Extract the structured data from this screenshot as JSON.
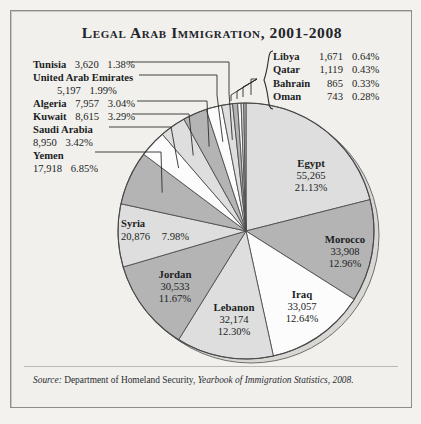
{
  "figure": {
    "title": "Legal Arab Immigration, 2001-2008",
    "source_prefix": "Source:",
    "source_agency": "Department of Homeland Security,",
    "source_publication": "Yearbook of Immigration Statistics, 2008."
  },
  "colors": {
    "paper": "#f1f0ec",
    "border": "#8d8d8d",
    "gray_slice": "#b4b4b4",
    "light_slice": "#dedede",
    "white_slice": "#fcfcfc",
    "outline": "#4a4a4a",
    "text": "#1c1e24"
  },
  "slice_labels": [
    {
      "name": "Egypt",
      "value": "55,265",
      "percent": "21.13%"
    },
    {
      "name": "Morocco",
      "value": "33,908",
      "percent": "12.96%"
    },
    {
      "name": "Iraq",
      "value": "33,057",
      "percent": "12.64%"
    },
    {
      "name": "Lebanon",
      "value": "32,174",
      "percent": "12.30%"
    },
    {
      "name": "Jordan",
      "value": "30,533",
      "percent": "11.67%"
    },
    {
      "name": "Syria",
      "value": "20,876",
      "percent": "7.98%"
    }
  ],
  "left_labels": [
    {
      "name": "Tunisia",
      "value": "3,620",
      "percent": "1.38%",
      "wrap": false
    },
    {
      "name": "United Arab Emirates",
      "value": "5,197",
      "percent": "1.99%",
      "wrap": true
    },
    {
      "name": "Algeria",
      "value": "7,957",
      "percent": "3.04%",
      "wrap": false
    },
    {
      "name": "Kuwait",
      "value": "8,615",
      "percent": "3.29%",
      "wrap": false
    },
    {
      "name": "Saudi Arabia",
      "value": "8,950",
      "percent": "3.42%",
      "wrap": true
    },
    {
      "name": "Yemen",
      "value": "17,918",
      "percent": "6.85%",
      "wrap": true
    }
  ],
  "right_labels": [
    {
      "name": "Libya",
      "value": "1,671",
      "percent": "0.64%"
    },
    {
      "name": "Qatar",
      "value": "1,119",
      "percent": "0.43%"
    },
    {
      "name": "Bahrain",
      "value": "865",
      "percent": "0.33%"
    },
    {
      "name": "Oman",
      "value": "743",
      "percent": "0.28%"
    }
  ],
  "chart_data": {
    "type": "pie",
    "title": "Legal Arab Immigration, 2001-2008",
    "xlabel": "",
    "ylabel": "",
    "units": "immigrants",
    "total": 261560,
    "start_angle_deg": 0,
    "direction": "clockwise",
    "legend": "labels placed on slices and via leader lines",
    "categories": [
      "Egypt",
      "Morocco",
      "Iraq",
      "Lebanon",
      "Jordan",
      "Syria",
      "Yemen",
      "Saudi Arabia",
      "Kuwait",
      "Algeria",
      "United Arab Emirates",
      "Tunisia",
      "Libya",
      "Qatar",
      "Bahrain",
      "Oman"
    ],
    "values": [
      55265,
      33908,
      33057,
      32174,
      30533,
      20876,
      17918,
      8950,
      8615,
      7957,
      5197,
      3620,
      1671,
      1119,
      865,
      743
    ],
    "percents": [
      21.13,
      12.96,
      12.64,
      12.3,
      11.67,
      7.98,
      6.85,
      3.42,
      3.29,
      3.04,
      1.99,
      1.38,
      0.64,
      0.43,
      0.33,
      0.28
    ],
    "fills": [
      "#dedede",
      "#b4b4b4",
      "#fcfcfc",
      "#dedede",
      "#b4b4b4",
      "#dedede",
      "#b4b4b4",
      "#fcfcfc",
      "#dedede",
      "#b4b4b4",
      "#fcfcfc",
      "#dedede",
      "#b4b4b4",
      "#fcfcfc",
      "#dedede",
      "#b4b4b4"
    ]
  }
}
